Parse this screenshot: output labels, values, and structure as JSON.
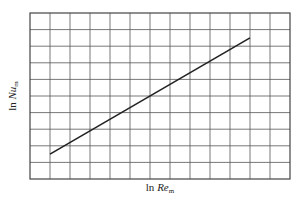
{
  "chart_data": {
    "type": "line",
    "title": "",
    "xlabel": "ln Re_m",
    "ylabel": "ln Nu_m",
    "xlabel_parts": {
      "prefix": "ln ",
      "var": "Re",
      "sub": "m"
    },
    "ylabel_parts": {
      "prefix": "ln ",
      "var": "Nu",
      "sub": "m"
    },
    "grid": true,
    "grid_columns": 13,
    "grid_rows": 10,
    "x_ticks": [],
    "y_ticks": [],
    "series": [
      {
        "name": "ln Nu_m vs ln Re_m",
        "x": [
          1,
          11
        ],
        "y": [
          1.5,
          8.5
        ]
      }
    ],
    "xlim": [
      0,
      13
    ],
    "ylim": [
      0,
      10
    ],
    "legend": null,
    "colors": {
      "line": "#222222",
      "grid": "#555555",
      "background": "#ffffff"
    }
  }
}
